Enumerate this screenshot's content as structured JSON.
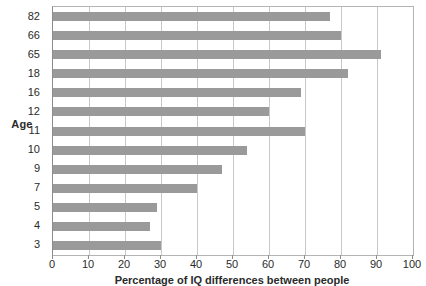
{
  "chart_data": {
    "type": "bar",
    "orientation": "horizontal",
    "title": "",
    "xlabel": "Percentage of IQ differences between people",
    "ylabel": "Age",
    "categories": [
      "82",
      "66",
      "65",
      "18",
      "16",
      "12",
      "11",
      "10",
      "9",
      "7",
      "5",
      "4",
      "3"
    ],
    "values": [
      77,
      80,
      91,
      82,
      69,
      60,
      70,
      54,
      47,
      40,
      29,
      27,
      30
    ],
    "xlim": [
      0,
      100
    ],
    "xticks": [
      0,
      10,
      20,
      30,
      40,
      50,
      60,
      70,
      80,
      90,
      100
    ],
    "xtick_labels": [
      "0",
      "10",
      "20",
      "30",
      "40",
      "50",
      "60",
      "70",
      "80",
      "90",
      "100"
    ],
    "grid": "vertical",
    "legend": null,
    "bar_color": "#9a9a9a",
    "grid_color": "#c8c8c8",
    "axis_color": "#8c8c8c"
  }
}
